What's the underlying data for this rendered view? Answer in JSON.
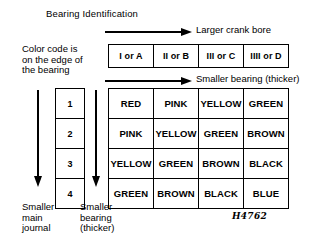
{
  "diagram": {
    "title": "Bearing Identification",
    "figure_reference": "H4762",
    "color_code_note": "Color code is\non the edge of\nthe bearing",
    "arrows": {
      "horizontal_top_label": "Larger crank bore",
      "horizontal_bottom_label": "Smaller bearing (thicker)",
      "vertical_left_label": "Smaller\nmain\njournal",
      "vertical_right_label": "Smaller\nbearing\n(thicker)"
    }
  },
  "bore_header": {
    "cells": [
      "I or A",
      "II or B",
      "III or C",
      "IIII or D"
    ]
  },
  "journal_numbers": {
    "cells": [
      "1",
      "2",
      "3",
      "4"
    ]
  },
  "color_matrix": {
    "rows": [
      [
        "RED",
        "PINK",
        "YELLOW",
        "GREEN"
      ],
      [
        "PINK",
        "YELLOW",
        "GREEN",
        "BROWN"
      ],
      [
        "YELLOW",
        "GREEN",
        "BROWN",
        "BLACK"
      ],
      [
        "GREEN",
        "BROWN",
        "BLACK",
        "BLUE"
      ]
    ]
  },
  "palette": {
    "ink": "#000000",
    "paper": "#ffffff"
  }
}
